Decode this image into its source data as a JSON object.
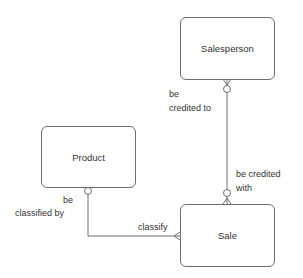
{
  "diagram": {
    "type": "entity-relationship",
    "entities": [
      {
        "id": "salesperson",
        "name": "Salesperson"
      },
      {
        "id": "product",
        "name": "Product"
      },
      {
        "id": "sale",
        "name": "Sale"
      }
    ],
    "relationships": [
      {
        "from": "salesperson",
        "to": "sale",
        "label_from_line1": "be",
        "label_from_line2": "credited to",
        "label_to_line1": "be credited",
        "label_to_line2": "with",
        "salesperson_end": "zero-or-many",
        "sale_end": "zero-or-many"
      },
      {
        "from": "product",
        "to": "sale",
        "label_from_line1": "be",
        "label_from_line2": "classified by",
        "label_to": "classify",
        "product_end": "zero-or-one",
        "sale_end": "many"
      }
    ],
    "colors": {
      "line": "#6e6e6e",
      "text": "#333333",
      "background": "#ffffff"
    }
  }
}
